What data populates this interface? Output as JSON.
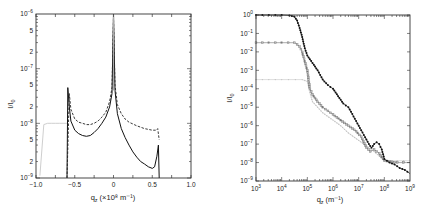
{
  "chart_data": [
    {
      "type": "line",
      "panel": "left",
      "title": "",
      "xlabel": "q_z (×10^8 m^-1)",
      "ylabel": "I/I_0",
      "xscale": "linear",
      "yscale": "log",
      "xlim": [
        -1.0,
        1.0
      ],
      "ylim": [
        1e-09,
        1e-06
      ],
      "xticks": [
        "-1.0",
        "-0.5",
        "0",
        "0.5",
        "1.0"
      ],
      "yticks": [
        "10^-9",
        "2",
        "5",
        "10^-8",
        "2",
        "5",
        "10^-7",
        "2",
        "5",
        "10^-6"
      ],
      "grid": false,
      "legend": null,
      "series": [
        {
          "name": "solid",
          "style": "solid black",
          "x": [
            -0.6,
            -0.59,
            -0.57,
            -0.55,
            -0.5,
            -0.45,
            -0.4,
            -0.35,
            -0.3,
            -0.25,
            -0.2,
            -0.15,
            -0.1,
            -0.05,
            -0.02,
            0.0,
            0.02,
            0.05,
            0.1,
            0.15,
            0.2,
            0.25,
            0.3,
            0.35,
            0.4,
            0.45,
            0.5,
            0.53,
            0.56,
            0.58,
            0.59
          ],
          "y": [
            1e-09,
            4.5e-08,
            2e-08,
            1.1e-08,
            7.5e-09,
            6.5e-09,
            6e-09,
            5.8e-09,
            6e-09,
            6.8e-09,
            8e-09,
            1e-08,
            1.3e-08,
            2e-08,
            3.5e-08,
            1e-06,
            4e-08,
            1.5e-08,
            8e-09,
            5.5e-09,
            4e-09,
            3e-09,
            2.4e-09,
            2e-09,
            1.8e-09,
            1.6e-09,
            1.5e-09,
            1.6e-09,
            2.5e-09,
            4e-09,
            1e-09
          ]
        },
        {
          "name": "dashed",
          "style": "dashed black",
          "x": [
            -0.6,
            -0.57,
            -0.55,
            -0.5,
            -0.45,
            -0.4,
            -0.35,
            -0.3,
            -0.25,
            -0.2,
            -0.15,
            -0.1,
            -0.05,
            -0.02,
            0.0,
            0.02,
            0.05,
            0.1,
            0.15,
            0.2,
            0.3,
            0.4,
            0.5,
            0.55,
            0.57,
            0.59
          ],
          "y": [
            1e-09,
            3.5e-08,
            1.8e-08,
            1.2e-08,
            1.05e-08,
            1e-08,
            9.5e-09,
            9.5e-09,
            1e-08,
            1.1e-08,
            1.3e-08,
            1.6e-08,
            2.5e-08,
            4.5e-08,
            9e-07,
            5e-08,
            2.2e-08,
            1.5e-08,
            1.2e-08,
            1.05e-08,
            9e-09,
            8e-09,
            7.5e-09,
            7.5e-09,
            8e-09,
            5e-09
          ]
        },
        {
          "name": "light gray",
          "style": "light gray with markers",
          "x": [
            -0.95,
            -0.9,
            -0.85,
            -0.8,
            -0.75,
            -0.7,
            -0.65,
            -0.6
          ],
          "y": [
            1.1e-09,
            9.5e-09,
            1e-08,
            1e-08,
            1e-08,
            1e-08,
            1e-08,
            1e-08
          ]
        }
      ]
    },
    {
      "type": "scatter",
      "panel": "right",
      "title": "",
      "xlabel": "q_z (m^-1)",
      "ylabel": "I/I_0",
      "xscale": "log",
      "yscale": "log",
      "xlim": [
        1000.0,
        1000000000.0
      ],
      "ylim": [
        1e-09,
        1.0
      ],
      "xticks": [
        "10^3",
        "10^4",
        "10^5",
        "10^6",
        "10^7",
        "10^8",
        "10^9"
      ],
      "yticks": [
        "10^-9",
        "10^-8",
        "10^-7",
        "10^-6",
        "10^-5",
        "10^-4",
        "10^-3",
        "10^-2",
        "10^-1",
        "10^0"
      ],
      "grid": false,
      "legend": null,
      "series": [
        {
          "name": "black filled",
          "style": "black filled markers",
          "logx": [
            3.0,
            4.0,
            4.3,
            4.5,
            4.6,
            4.7,
            4.8,
            4.9,
            5.0,
            5.2,
            5.4,
            5.6,
            5.8,
            6.0,
            6.2,
            6.4,
            6.6,
            6.8,
            7.0,
            7.2,
            7.4,
            7.5,
            7.6,
            7.7,
            7.8,
            7.9,
            8.0,
            8.2,
            8.4,
            8.6,
            8.8,
            9.0
          ],
          "logy": [
            0.0,
            0.0,
            -0.02,
            -0.1,
            -0.3,
            -0.7,
            -1.2,
            -1.8,
            -2.2,
            -2.6,
            -3.0,
            -3.5,
            -3.8,
            -4.0,
            -4.4,
            -4.8,
            -5.0,
            -5.5,
            -6.0,
            -6.5,
            -7.0,
            -7.2,
            -7.0,
            -6.9,
            -7.0,
            -7.3,
            -7.8,
            -8.0,
            -8.1,
            -8.3,
            -8.4,
            -8.6
          ]
        },
        {
          "name": "gray open",
          "style": "gray open markers",
          "logx": [
            3.0,
            4.0,
            4.5,
            4.7,
            4.8,
            4.9,
            5.0,
            5.05,
            5.1,
            5.2,
            5.4,
            5.6,
            5.8,
            6.0,
            6.3,
            6.6,
            6.9,
            7.1,
            7.3,
            7.45,
            7.6,
            7.8,
            8.0,
            8.5,
            9.0
          ],
          "logy": [
            -1.5,
            -1.5,
            -1.5,
            -1.7,
            -2.0,
            -2.5,
            -3.0,
            -3.5,
            -4.0,
            -4.3,
            -4.7,
            -5.0,
            -5.2,
            -5.4,
            -5.7,
            -6.0,
            -6.3,
            -6.6,
            -7.2,
            -7.4,
            -7.3,
            -7.5,
            -7.9,
            -8.0,
            -8.0
          ]
        },
        {
          "name": "light gray",
          "style": "light gray markers",
          "logx": [
            3.0,
            4.0,
            4.8,
            5.0,
            5.1,
            5.2,
            5.4,
            5.6,
            6.0,
            6.3,
            6.6,
            7.0,
            7.3,
            7.6,
            8.0,
            8.5,
            9.0
          ],
          "logy": [
            -3.5,
            -3.5,
            -3.5,
            -3.6,
            -4.2,
            -4.7,
            -5.0,
            -5.3,
            -5.7,
            -6.0,
            -6.4,
            -6.8,
            -7.1,
            -7.4,
            -7.9,
            -7.9,
            -7.9
          ]
        }
      ]
    }
  ],
  "labels": {
    "left_ylabel_main": "I/I",
    "left_ylabel_sub": "0",
    "left_xlabel_main": "q",
    "left_xlabel_sub": "z",
    "left_xlabel_unit": "(×10⁸ m⁻¹)",
    "right_ylabel_main": "I/I",
    "right_ylabel_sub": "0",
    "right_xlabel_main": "q",
    "right_xlabel_sub": "z",
    "right_xlabel_unit": "(m⁻¹)"
  }
}
